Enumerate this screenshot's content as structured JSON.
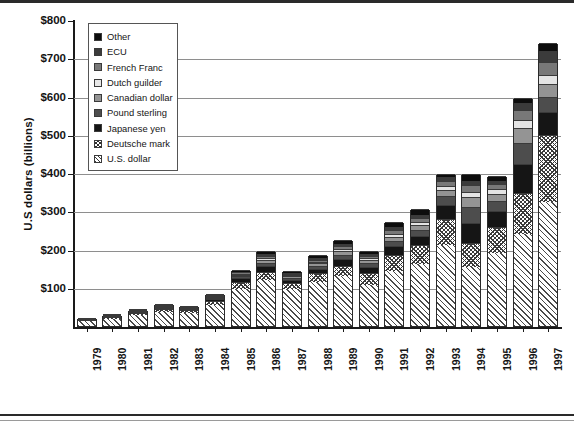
{
  "chart_data": {
    "type": "bar",
    "subtype": "stacked-bar",
    "title": "",
    "xlabel": "",
    "ylabel": "U.S dollars (billions)",
    "ylim": [
      0,
      800
    ],
    "ytick_labels": [
      "$800",
      "$700",
      "$600",
      "$500",
      "$400",
      "$300",
      "$200",
      "$100"
    ],
    "ytick_values": [
      800,
      700,
      600,
      500,
      400,
      300,
      200,
      100
    ],
    "grid": true,
    "legend_position": "upper-left-inside",
    "categories": [
      "1979",
      "1980",
      "1981",
      "1982",
      "1983",
      "1984",
      "1985",
      "1986",
      "1987",
      "1988",
      "1989",
      "1990",
      "1991",
      "1992",
      "1993",
      "1994",
      "1995",
      "1996",
      "1997"
    ],
    "series": [
      {
        "name": "U.S. dollar",
        "pattern": "diagonal-hatch",
        "values": [
          14,
          19,
          28,
          37,
          34,
          56,
          98,
          120,
          96,
          116,
          130,
          108,
          143,
          163,
          213,
          155,
          190,
          240,
          325
        ]
      },
      {
        "name": "Deutsche mark",
        "pattern": "speckle",
        "values": [
          3,
          4,
          5,
          7,
          7,
          10,
          18,
          22,
          17,
          22,
          28,
          30,
          42,
          48,
          66,
          62,
          70,
          108,
          175
        ]
      },
      {
        "name": "Japanese yen",
        "pattern": "solid-black",
        "values": [
          1,
          2,
          3,
          4,
          3,
          5,
          9,
          14,
          8,
          12,
          17,
          16,
          24,
          25,
          38,
          52,
          42,
          75,
          60
        ]
      },
      {
        "name": "Pound sterling",
        "pattern": "dark-gray",
        "values": [
          1,
          1,
          2,
          2,
          2,
          3,
          5,
          9,
          5,
          8,
          11,
          10,
          14,
          16,
          22,
          42,
          26,
          55,
          38
        ]
      },
      {
        "name": "Canadian dollar",
        "pattern": "mid-gray",
        "values": [
          1,
          1,
          1,
          2,
          2,
          2,
          4,
          7,
          4,
          6,
          9,
          8,
          11,
          12,
          17,
          25,
          18,
          40,
          35
        ]
      },
      {
        "name": "Dutch guilder",
        "pattern": "very-light-gray",
        "values": [
          0,
          1,
          1,
          1,
          1,
          2,
          3,
          5,
          3,
          4,
          6,
          5,
          7,
          8,
          11,
          14,
          11,
          20,
          22
        ]
      },
      {
        "name": "French Franc",
        "pattern": "gray",
        "values": [
          0,
          1,
          1,
          1,
          1,
          2,
          3,
          5,
          3,
          5,
          7,
          6,
          9,
          10,
          13,
          18,
          13,
          26,
          35
        ]
      },
      {
        "name": "ECU",
        "pattern": "darker-gray",
        "values": [
          0,
          0,
          1,
          1,
          1,
          1,
          2,
          5,
          3,
          4,
          6,
          5,
          8,
          9,
          9,
          12,
          9,
          18,
          28
        ]
      },
      {
        "name": "Other",
        "pattern": "black",
        "values": [
          0,
          1,
          1,
          2,
          2,
          3,
          4,
          9,
          5,
          8,
          10,
          9,
          13,
          15,
          8,
          18,
          14,
          14,
          23
        ]
      }
    ],
    "totals": [
      20,
      30,
      43,
      57,
      53,
      84,
      146,
      196,
      144,
      185,
      224,
      197,
      271,
      306,
      397,
      398,
      393,
      596,
      741
    ],
    "legend_entries": [
      "Other",
      "ECU",
      "French Franc",
      "Dutch guilder",
      "Canadian dollar",
      "Pound sterling",
      "Japanese yen",
      "Deutsche mark",
      "U.S. dollar"
    ]
  },
  "caption": ""
}
